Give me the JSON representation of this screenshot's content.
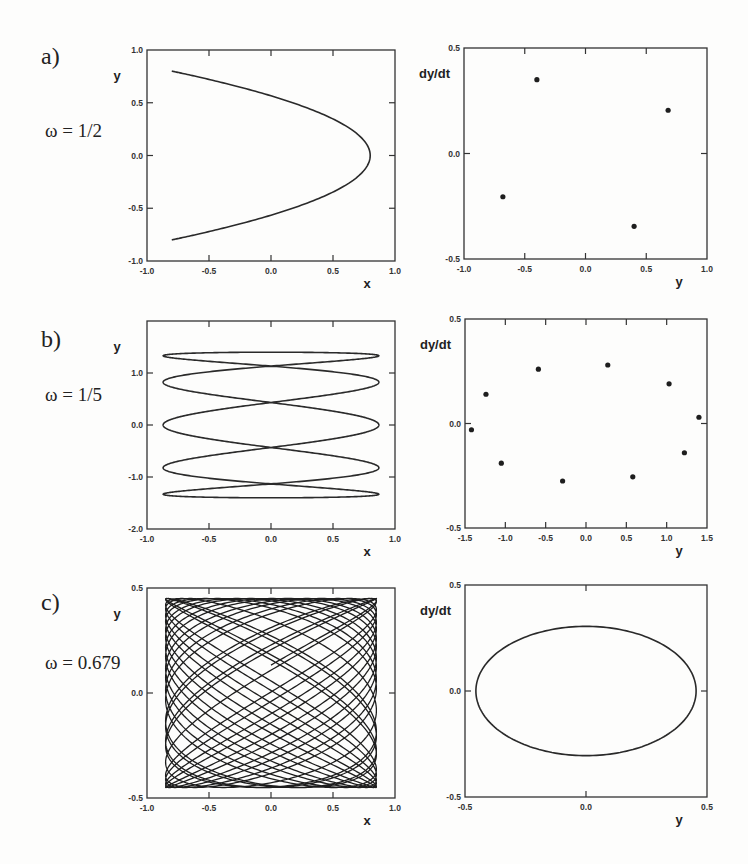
{
  "panels": [
    {
      "id": "a",
      "label": "a)",
      "omega_text": "ω = 1/2"
    },
    {
      "id": "b",
      "label": "b)",
      "omega_text": "ω = 1/5"
    },
    {
      "id": "c",
      "label": "c)",
      "omega_text": "ω = 0.679"
    }
  ],
  "chart_data": [
    {
      "type": "line",
      "panel": "a",
      "title": "",
      "xlabel": "x",
      "ylabel": "y",
      "xlim": [
        -1.0,
        1.0
      ],
      "ylim": [
        -1.0,
        1.0
      ],
      "xticks": [
        "-1.0",
        "-0.5",
        "0.0",
        "0.5",
        "1.0"
      ],
      "yticks": [
        "-1.0",
        "-0.5",
        "0.0",
        "0.5",
        "1.0"
      ],
      "curve": {
        "kind": "lissajous",
        "ax": 0.8,
        "wx": 2,
        "phx": 1.5708,
        "ay": 0.8,
        "wy": 1,
        "phy": 0,
        "samples": 400
      },
      "grid": false
    },
    {
      "type": "scatter",
      "panel": "a",
      "title": "",
      "xlabel": "y",
      "ylabel": "dy/dt",
      "xlim": [
        -1.0,
        1.0
      ],
      "ylim": [
        -0.5,
        0.5
      ],
      "xticks": [
        "-1.0",
        "-0.5",
        "0.0",
        "0.5",
        "1.0"
      ],
      "yticks": [
        "-0.5",
        "0.0",
        "0.5"
      ],
      "points": [
        [
          -0.4,
          0.35
        ],
        [
          0.68,
          0.205
        ],
        [
          -0.68,
          -0.205
        ],
        [
          0.4,
          -0.345
        ]
      ],
      "grid": false
    },
    {
      "type": "line",
      "panel": "b",
      "title": "",
      "xlabel": "x",
      "ylabel": "y",
      "xlim": [
        -1.0,
        1.0
      ],
      "ylim": [
        -2.0,
        2.0
      ],
      "xticks": [
        "-1.0",
        "-0.5",
        "0.0",
        "0.5",
        "1.0"
      ],
      "yticks": [
        "-2.0",
        "-1.0",
        "0.0",
        "1.0"
      ],
      "curve": {
        "kind": "lissajous",
        "ax": 0.87,
        "wx": 5,
        "phx": 1.5708,
        "ay": 1.4,
        "wy": 1,
        "phy": 0,
        "samples": 1200
      },
      "grid": false
    },
    {
      "type": "scatter",
      "panel": "b",
      "title": "",
      "xlabel": "y",
      "ylabel": "dy/dt",
      "xlim": [
        -1.5,
        1.5
      ],
      "ylim": [
        -0.5,
        0.5
      ],
      "xticks": [
        "-1.5",
        "-1.0",
        "-0.5",
        "0.0",
        "0.5",
        "1.0",
        "1.5"
      ],
      "yticks": [
        "-0.5",
        "0.0",
        "0.5"
      ],
      "points": [
        [
          -1.42,
          -0.03
        ],
        [
          -1.24,
          0.14
        ],
        [
          -1.05,
          -0.19
        ],
        [
          -0.59,
          0.26
        ],
        [
          -0.29,
          -0.275
        ],
        [
          0.27,
          0.28
        ],
        [
          0.58,
          -0.255
        ],
        [
          1.03,
          0.19
        ],
        [
          1.22,
          -0.14
        ],
        [
          1.4,
          0.03
        ]
      ],
      "grid": false
    },
    {
      "type": "line",
      "panel": "c",
      "title": "",
      "xlabel": "x",
      "ylabel": "y",
      "xlim": [
        -1.0,
        1.0
      ],
      "ylim": [
        -0.5,
        0.5
      ],
      "xticks": [
        "-1.0",
        "-0.5",
        "0.0",
        "0.5",
        "1.0"
      ],
      "yticks": [
        "-0.5",
        "0.0",
        "0.5"
      ],
      "curve": {
        "kind": "lissajous",
        "ax": 0.85,
        "wx": 1,
        "phx": 0,
        "ay": 0.45,
        "wy": 0.679,
        "phy": 0.3,
        "samples": 5000,
        "tmax": 150
      },
      "grid": false
    },
    {
      "type": "line",
      "panel": "c",
      "title": "",
      "xlabel": "y",
      "ylabel": "dy/dt",
      "xlim": [
        -0.5,
        0.5
      ],
      "ylim": [
        -0.5,
        0.5
      ],
      "xticks": [
        "-0.5",
        "0.0",
        "0.5"
      ],
      "yticks": [
        "-0.5",
        "0.0",
        "0.5"
      ],
      "curve": {
        "kind": "ellipse",
        "a": 0.455,
        "b": 0.305,
        "samples": 200
      },
      "grid": false
    }
  ],
  "layout": {
    "frames": [
      {
        "x0": 147,
        "y0": 50,
        "x1": 395,
        "y1": 261
      },
      {
        "x0": 464,
        "y0": 48,
        "x1": 707,
        "y1": 259
      },
      {
        "x0": 147,
        "y0": 321,
        "x1": 395,
        "y1": 529
      },
      {
        "x0": 465,
        "y0": 319,
        "x1": 707,
        "y1": 528
      },
      {
        "x0": 147,
        "y0": 588,
        "x1": 395,
        "y1": 798
      },
      {
        "x0": 465,
        "y0": 585,
        "x1": 707,
        "y1": 797
      }
    ]
  }
}
